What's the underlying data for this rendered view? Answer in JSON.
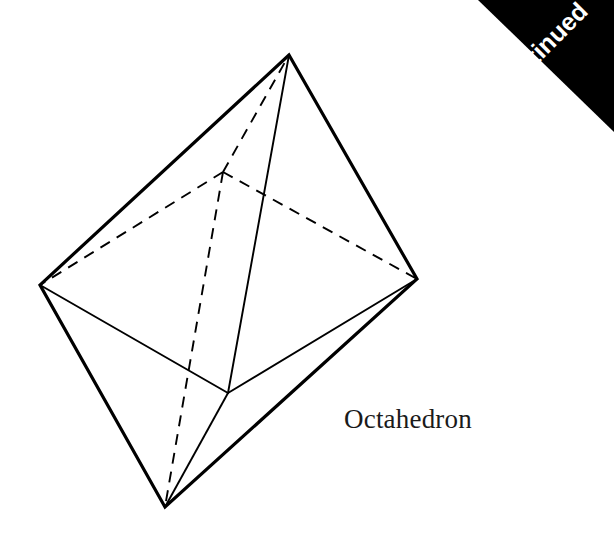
{
  "page": {
    "background_color": "#ffffff",
    "width": 614,
    "height": 538
  },
  "corner_tab": {
    "label": "ontinued",
    "full_word_hint": "continued",
    "background_color": "#000000",
    "text_color": "#ffffff",
    "rotation_degrees": -45,
    "shape": "triangle-top-right"
  },
  "figure": {
    "caption": "Octahedron",
    "caption_color": "#1a1a1a",
    "stroke_color": "#000000",
    "outline_stroke_width": 3.2,
    "inner_stroke_width": 1.9,
    "hidden_stroke_width": 1.9,
    "hidden_dash_pattern": "11 8",
    "vertices": {
      "top": [
        289,
        55
      ],
      "left": [
        40,
        285
      ],
      "right": [
        417,
        279
      ],
      "bottom": [
        165,
        507
      ],
      "front": [
        228,
        393
      ],
      "back": [
        223,
        172
      ]
    },
    "outline_edges": [
      [
        "top",
        "left"
      ],
      [
        "top",
        "right"
      ],
      [
        "left",
        "bottom"
      ],
      [
        "right",
        "bottom"
      ]
    ],
    "visible_inner_edges": [
      [
        "top",
        "front"
      ],
      [
        "left",
        "front"
      ],
      [
        "right",
        "front"
      ],
      [
        "bottom",
        "front"
      ]
    ],
    "hidden_edges": [
      [
        "back",
        "top"
      ],
      [
        "back",
        "left"
      ],
      [
        "back",
        "right"
      ],
      [
        "back",
        "bottom"
      ]
    ]
  }
}
